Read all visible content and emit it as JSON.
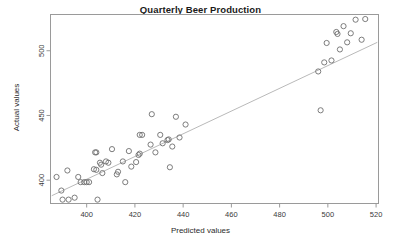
{
  "chart_data": {
    "type": "scatter",
    "title": "Quarterly Beer Production",
    "xlabel": "Predicted values",
    "ylabel": "Actual values",
    "xlim": [
      385,
      521
    ],
    "ylim": [
      382,
      528
    ],
    "xticks": [
      400,
      420,
      440,
      460,
      480,
      500,
      520
    ],
    "yticks": [
      400,
      450,
      500
    ],
    "grid": false,
    "legend": null,
    "marker": "open-circle",
    "marker_color": "#6e6e6e",
    "reference_line": {
      "label": "y = x diagonal reference line",
      "color": "#b9b9b9",
      "x": [
        385.5,
        520.5
      ],
      "y": [
        388.0,
        506.5
      ]
    },
    "points": [
      {
        "x": 387.5,
        "y": 402.5
      },
      {
        "x": 389.5,
        "y": 392.0
      },
      {
        "x": 390.0,
        "y": 385.0
      },
      {
        "x": 392.0,
        "y": 407.5
      },
      {
        "x": 392.5,
        "y": 385.0
      },
      {
        "x": 395.0,
        "y": 386.5
      },
      {
        "x": 396.5,
        "y": 402.5
      },
      {
        "x": 397.5,
        "y": 398.5
      },
      {
        "x": 399.0,
        "y": 398.5
      },
      {
        "x": 400.0,
        "y": 398.5
      },
      {
        "x": 401.0,
        "y": 398.5
      },
      {
        "x": 403.0,
        "y": 408.5
      },
      {
        "x": 403.5,
        "y": 421.5
      },
      {
        "x": 404.0,
        "y": 421.5
      },
      {
        "x": 404.0,
        "y": 408.0
      },
      {
        "x": 404.5,
        "y": 385.0
      },
      {
        "x": 405.5,
        "y": 413.5
      },
      {
        "x": 406.0,
        "y": 412.0
      },
      {
        "x": 406.5,
        "y": 405.5
      },
      {
        "x": 408.0,
        "y": 414.5
      },
      {
        "x": 409.0,
        "y": 413.5
      },
      {
        "x": 410.5,
        "y": 424.0
      },
      {
        "x": 412.5,
        "y": 404.5
      },
      {
        "x": 413.0,
        "y": 406.5
      },
      {
        "x": 415.0,
        "y": 414.5
      },
      {
        "x": 416.0,
        "y": 398.5
      },
      {
        "x": 417.5,
        "y": 422.5
      },
      {
        "x": 418.5,
        "y": 410.5
      },
      {
        "x": 420.5,
        "y": 414.0
      },
      {
        "x": 421.5,
        "y": 419.5
      },
      {
        "x": 422.0,
        "y": 420.5
      },
      {
        "x": 422.0,
        "y": 435.0
      },
      {
        "x": 423.0,
        "y": 435.0
      },
      {
        "x": 426.5,
        "y": 427.5
      },
      {
        "x": 427.0,
        "y": 451.0
      },
      {
        "x": 428.5,
        "y": 421.5
      },
      {
        "x": 430.5,
        "y": 435.0
      },
      {
        "x": 431.5,
        "y": 428.5
      },
      {
        "x": 433.5,
        "y": 431.0
      },
      {
        "x": 434.0,
        "y": 431.5
      },
      {
        "x": 434.5,
        "y": 410.0
      },
      {
        "x": 435.5,
        "y": 426.0
      },
      {
        "x": 437.0,
        "y": 449.0
      },
      {
        "x": 438.5,
        "y": 433.0
      },
      {
        "x": 441.0,
        "y": 443.0
      },
      {
        "x": 496.0,
        "y": 484.0
      },
      {
        "x": 497.0,
        "y": 454.0
      },
      {
        "x": 498.5,
        "y": 491.0
      },
      {
        "x": 499.5,
        "y": 506.0
      },
      {
        "x": 501.5,
        "y": 492.5
      },
      {
        "x": 503.5,
        "y": 514.5
      },
      {
        "x": 504.0,
        "y": 513.0
      },
      {
        "x": 505.0,
        "y": 501.0
      },
      {
        "x": 506.5,
        "y": 519.0
      },
      {
        "x": 508.0,
        "y": 506.5
      },
      {
        "x": 509.5,
        "y": 513.5
      },
      {
        "x": 511.5,
        "y": 524.0
      },
      {
        "x": 514.0,
        "y": 508.5
      },
      {
        "x": 515.5,
        "y": 524.5
      }
    ]
  }
}
